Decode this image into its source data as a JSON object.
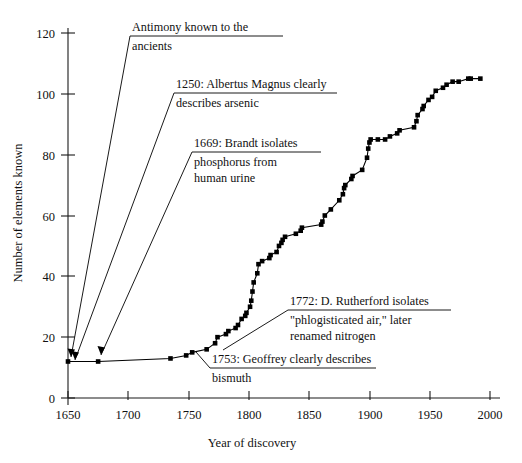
{
  "chart_data": {
    "type": "line",
    "title": "",
    "xlabel": "Year of discovery",
    "ylabel": "Number of elements known",
    "xlim": [
      1650,
      2000
    ],
    "ylim": [
      0,
      125
    ],
    "xticks": [
      1650,
      1700,
      1750,
      1800,
      1850,
      1900,
      1950,
      2000
    ],
    "xticklabels": [
      "1650",
      "1700",
      "1750",
      "1800",
      "1850",
      "1900",
      "1950",
      "2000"
    ],
    "yticks": [
      0,
      20,
      40,
      60,
      80,
      100,
      120
    ],
    "yticklabels": [
      "0",
      "20",
      "40",
      "60",
      "80",
      "100",
      "120"
    ],
    "grid": false,
    "legend": "none",
    "marker": "filled-square",
    "series": [
      {
        "name": "Cumulative elements known",
        "x": [
          1650,
          1675,
          1735,
          1748,
          1753,
          1765,
          1772,
          1774,
          1781,
          1783,
          1789,
          1791,
          1794,
          1797,
          1798,
          1801,
          1802,
          1803,
          1804,
          1807,
          1808,
          1811,
          1817,
          1818,
          1823,
          1825,
          1827,
          1828,
          1830,
          1839,
          1843,
          1844,
          1860,
          1861,
          1863,
          1868,
          1875,
          1878,
          1879,
          1880,
          1885,
          1886,
          1894,
          1898,
          1899,
          1900,
          1901,
          1907,
          1913,
          1917,
          1923,
          1925,
          1937,
          1939,
          1940,
          1944,
          1945,
          1949,
          1952,
          1955,
          1961,
          1964,
          1969,
          1974,
          1982,
          1984,
          1992
        ],
        "y": [
          12,
          12,
          13,
          14,
          15,
          16,
          18,
          20,
          21,
          22,
          23,
          24,
          26,
          27,
          28,
          30,
          32,
          35,
          38,
          41,
          44,
          45,
          46,
          47,
          48,
          50,
          51,
          52,
          53,
          54,
          55,
          56,
          57,
          58,
          60,
          62,
          65,
          67,
          69,
          70,
          72,
          73,
          75,
          79,
          82,
          84,
          85,
          85,
          85,
          86,
          87,
          88,
          89,
          91,
          93,
          95,
          96,
          98,
          99,
          101,
          102,
          103,
          104,
          104,
          105,
          105,
          105
        ]
      }
    ],
    "annotations": [
      {
        "id": "antimony",
        "lines": [
          "Antimony known to the",
          "ancients"
        ],
        "underline_after_line": 1,
        "target": {
          "x": 1650,
          "y": 12
        }
      },
      {
        "id": "arsenic",
        "lines": [
          "1250: Albertus Magnus clearly",
          "describes arsenic"
        ],
        "underline_after_line": 1,
        "target": {
          "x": 1650,
          "y": 12
        }
      },
      {
        "id": "phosphorus",
        "lines": [
          "1669: Brandt isolates",
          "phosphorus from",
          "human urine"
        ],
        "underline_after_line": 1,
        "target": {
          "x": 1675,
          "y": 12
        }
      },
      {
        "id": "nitrogen",
        "lines": [
          "1772: D. Rutherford isolates",
          "\"phlogisticated air,\" later",
          "renamed nitrogen"
        ],
        "underline_after_line": 1,
        "target": {
          "x": 1772,
          "y": 18
        }
      },
      {
        "id": "bismuth",
        "lines": [
          "1753: Geoffrey clearly describes",
          "bismuth"
        ],
        "underline_after_line": 1,
        "target": {
          "x": 1753,
          "y": 15
        }
      }
    ]
  }
}
